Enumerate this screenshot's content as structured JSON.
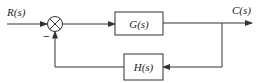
{
  "diagram": {
    "type": "block-diagram",
    "input_label": "R(s)",
    "output_label": "C(s)",
    "forward_block": {
      "label": "G(s)"
    },
    "feedback_block": {
      "label": "H(s)"
    },
    "summing_junction": {
      "feedback_sign": "−"
    },
    "colors": {
      "line": "#333333",
      "background": "#ffffff"
    }
  }
}
